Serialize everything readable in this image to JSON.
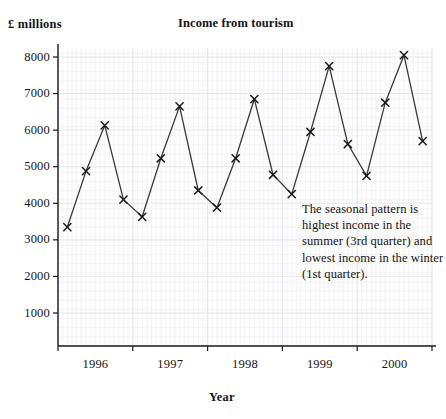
{
  "chart_data": {
    "type": "line",
    "title": "Income from tourism",
    "xlabel": "Year",
    "ylabel": "£ millions",
    "grid": true,
    "legend": "none",
    "marker": "x-cross",
    "ylim": [
      0,
      8400
    ],
    "yticks": [
      "1000",
      "2000",
      "3000",
      "4000",
      "5000",
      "6000",
      "7000",
      "8000"
    ],
    "ytick_values": [
      1000,
      2000,
      3000,
      4000,
      5000,
      6000,
      7000,
      8000
    ],
    "xticks": [
      "1996",
      "1997",
      "1998",
      "1999",
      "2000"
    ],
    "x_labels_quarterly": [
      "1996 Q1",
      "1996 Q2",
      "1996 Q3",
      "1996 Q4",
      "1997 Q1",
      "1997 Q2",
      "1997 Q3",
      "1997 Q4",
      "1998 Q1",
      "1998 Q2",
      "1998 Q3",
      "1998 Q4",
      "1999 Q1",
      "1999 Q2",
      "1999 Q3",
      "1999 Q4",
      "2000 Q1",
      "2000 Q2",
      "2000 Q3",
      "2000 Q4"
    ],
    "values": [
      3350,
      4880,
      6130,
      4100,
      3630,
      5230,
      6650,
      4350,
      3880,
      5230,
      6850,
      4780,
      4250,
      5950,
      7750,
      5620,
      4750,
      6750,
      8050,
      5700
    ],
    "annotations": [
      {
        "text": "The seasonal pattern is highest income in the summer (3rd quarter) and lowest income in the winter (1st quarter)."
      }
    ]
  },
  "style": {
    "line_color": "#3a3a3a",
    "marker_color": "#1a1a1a",
    "axis_color": "#1a1a1a",
    "grid_minor_color": "#eeeef2",
    "grid_major_color": "#e2e2e8",
    "plot_background": "#fdfdfe",
    "text_color": "#151515"
  }
}
